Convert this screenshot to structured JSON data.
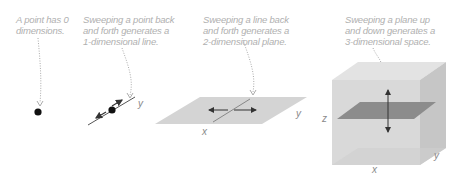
{
  "panels": [
    {
      "id": "point",
      "caption": "A point has 0\ndimensions.",
      "dimension": 0,
      "axes": []
    },
    {
      "id": "line",
      "caption": "Sweeping a point back\nand forth generates a\n1-dimensional line.",
      "dimension": 1,
      "axes": [
        "y"
      ]
    },
    {
      "id": "plane",
      "caption": "Sweeping a line back\nand forth generates a\n2-dimensional plane.",
      "dimension": 2,
      "axes": [
        "x",
        "y"
      ]
    },
    {
      "id": "space",
      "caption": "Sweeping a plane up\nand down generates a\n3-dimensional space.",
      "dimension": 3,
      "axes": [
        "x",
        "y",
        "z"
      ]
    }
  ],
  "labels": {
    "line_y": "y",
    "plane_x": "x",
    "plane_y": "y",
    "cube_x": "x",
    "cube_y": "y",
    "cube_z": "z"
  },
  "colors": {
    "caption_text": "#b0b0b0",
    "axis_text": "#8a8a8a",
    "plane_fill": "#d4d4d4",
    "cube_front": "#d9d9d9",
    "cube_side": "#c4c4c4",
    "cube_top": "#e6e6e6",
    "inner_plane": "#8c8c8c",
    "point": "#111111",
    "arrow": "#333333"
  }
}
